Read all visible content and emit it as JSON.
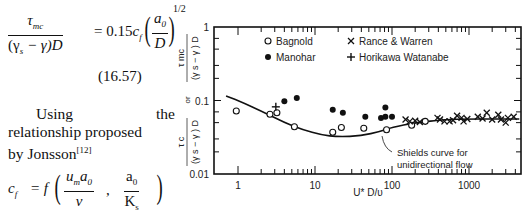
{
  "text_column": {
    "equation_1": {
      "lhs_numerator": "τ",
      "lhs_numerator_sub": "mc",
      "lhs_denominator": "(γ",
      "lhs_denominator_sub": "s",
      "lhs_denominator_rest": " − γ)D",
      "equals": "= 0.15",
      "cf": "c",
      "cf_sub": "f",
      "ratio_num": "a",
      "ratio_num_sub": "0",
      "ratio_den": "D",
      "exponent": "1/2"
    },
    "equation_number": "(16.57)",
    "paragraph": {
      "line1_a": "Using",
      "line1_b": "the",
      "line2": "relationship proposed",
      "line3": "by Jonsson",
      "citation": "[12]"
    },
    "equation_2": {
      "lhs": "c",
      "lhs_sub": "f",
      "equals": "= f",
      "arg1_num": "u",
      "arg1_num_sub": "m",
      "arg1_num_b": "a",
      "arg1_num_b_sub": "0",
      "arg1_den": "ν",
      "comma": ",",
      "arg2_num": "a",
      "arg2_num_sub": "0",
      "arg2_den": "K",
      "arg2_den_sub": "s"
    }
  },
  "chart_data": {
    "type": "scatter",
    "title": "",
    "xlabel": "U* D/υ",
    "ylabel": "τ_mc/((γs−γ)D) or τ_c/((γs−γ)D)",
    "ylabel_parts": {
      "top_num": "τ",
      "top_num_sub": "mc",
      "top_den": "(γ s − γ ) D",
      "or": "or",
      "bot_num": "τ",
      "bot_num_sub": "c",
      "bot_den": "(γ s − γ ) D"
    },
    "xscale": "log",
    "yscale": "log",
    "xlim": [
      0.7,
      4500
    ],
    "ylim": [
      0.01,
      1
    ],
    "x_tick_labels": [
      "1",
      "10",
      "100",
      "1000"
    ],
    "y_tick_labels": [
      "0.01",
      "0.1",
      "1"
    ],
    "grid": false,
    "legend": [
      {
        "marker": "open-circle",
        "label": "Bagnold"
      },
      {
        "marker": "filled-circle",
        "label": "Manohar"
      },
      {
        "marker": "x",
        "label": "Rance & Warren"
      },
      {
        "marker": "plus",
        "label": "Horikawa Watanabe"
      }
    ],
    "legend_position": "upper",
    "annotation": {
      "text_line1": "Shields curve for",
      "text_line2": "unidirectional flow"
    },
    "series": [
      {
        "name": "Bagnold",
        "marker": "open-circle",
        "points": [
          [
            0.95,
            0.072
          ],
          [
            2.6,
            0.065
          ],
          [
            3.2,
            0.068
          ],
          [
            5.4,
            0.044
          ],
          [
            17,
            0.037
          ],
          [
            22,
            0.043
          ],
          [
            43,
            0.042
          ],
          [
            85,
            0.04
          ],
          [
            180,
            0.046
          ],
          [
            270,
            0.052
          ]
        ]
      },
      {
        "name": "Manohar",
        "marker": "filled-circle",
        "points": [
          [
            4.0,
            0.098
          ],
          [
            5.8,
            0.108
          ],
          [
            17,
            0.075
          ],
          [
            23,
            0.068
          ],
          [
            45,
            0.06
          ],
          [
            72,
            0.058
          ],
          [
            82,
            0.08
          ],
          [
            82,
            0.06
          ],
          [
            100,
            0.06
          ]
        ]
      },
      {
        "name": "Rance & Warren",
        "marker": "x",
        "points": [
          [
            150,
            0.055
          ],
          [
            170,
            0.052
          ],
          [
            200,
            0.053
          ],
          [
            230,
            0.051
          ],
          [
            390,
            0.058
          ],
          [
            420,
            0.055
          ],
          [
            480,
            0.052
          ],
          [
            560,
            0.052
          ],
          [
            620,
            0.054
          ],
          [
            700,
            0.062
          ],
          [
            800,
            0.058
          ],
          [
            850,
            0.052
          ],
          [
            950,
            0.056
          ],
          [
            1300,
            0.06
          ],
          [
            1500,
            0.057
          ],
          [
            1700,
            0.068
          ],
          [
            2000,
            0.055
          ],
          [
            2400,
            0.064
          ],
          [
            2600,
            0.055
          ],
          [
            3000,
            0.05
          ],
          [
            3200,
            0.058
          ],
          [
            3800,
            0.06
          ]
        ]
      },
      {
        "name": "Horikawa Watanabe",
        "marker": "plus",
        "points": [
          [
            3.1,
            0.082
          ]
        ]
      }
    ],
    "shields_curve": {
      "name": "Shields curve for unidirectional flow",
      "points": [
        [
          0.7,
          0.115
        ],
        [
          1,
          0.1
        ],
        [
          2,
          0.072
        ],
        [
          4,
          0.05
        ],
        [
          7,
          0.04
        ],
        [
          12,
          0.034
        ],
        [
          20,
          0.032
        ],
        [
          40,
          0.033
        ],
        [
          70,
          0.038
        ],
        [
          100,
          0.043
        ],
        [
          200,
          0.05
        ],
        [
          500,
          0.055
        ],
        [
          1000,
          0.056
        ],
        [
          2000,
          0.056
        ],
        [
          4500,
          0.056
        ]
      ]
    }
  }
}
